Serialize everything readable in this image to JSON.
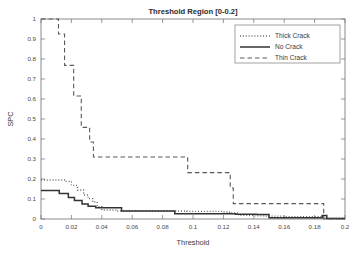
{
  "chart_data": {
    "type": "line",
    "title": "Threshold Region [0-0.2]",
    "xlabel": "Threshold",
    "ylabel": "SPC",
    "xlim": [
      0,
      0.2
    ],
    "ylim": [
      0,
      1
    ],
    "grid": false,
    "legend_position": "top-right",
    "xticks": [
      0,
      0.02,
      0.04,
      0.06,
      0.08,
      0.1,
      0.12,
      0.14,
      0.16,
      0.18,
      0.2
    ],
    "xticklabels": [
      "0",
      "0.02",
      "0.04",
      "0.06",
      "0.08",
      "0.1",
      "0.12",
      "0.14",
      "0.16",
      "0.18",
      "0.2"
    ],
    "yticks": [
      0,
      0.1,
      0.2,
      0.3,
      0.4,
      0.5,
      0.6,
      0.7,
      0.8,
      0.9,
      1
    ],
    "yticklabels": [
      "0",
      "0.1",
      "0.2",
      "0.3",
      "0.4",
      "0.5",
      "0.6",
      "0.7",
      "0.8",
      "0.9",
      "1"
    ],
    "series": [
      {
        "name": "Thick Crack",
        "style": "dotted",
        "color": "#555555",
        "x": [
          0,
          0.006,
          0.012,
          0.016,
          0.02,
          0.024,
          0.028,
          0.031,
          0.034,
          0.037,
          0.04,
          0.05,
          0.056,
          0.086,
          0.096,
          0.12,
          0.124,
          0.13,
          0.14,
          0.147,
          0.16,
          0.185,
          0.187,
          0.2
        ],
        "y": [
          0.195,
          0.195,
          0.195,
          0.188,
          0.168,
          0.145,
          0.12,
          0.102,
          0.085,
          0.062,
          0.045,
          0.04,
          0.04,
          0.04,
          0.038,
          0.035,
          0.03,
          0.018,
          0.016,
          0.014,
          0.012,
          0.01,
          0.004,
          0.004
        ]
      },
      {
        "name": "No Crack",
        "style": "solid",
        "color": "#333333",
        "x": [
          0,
          0.009,
          0.012,
          0.018,
          0.022,
          0.027,
          0.031,
          0.036,
          0.05,
          0.053,
          0.086,
          0.088,
          0.124,
          0.128,
          0.14,
          0.142,
          0.147,
          0.15,
          0.182,
          0.185,
          0.188,
          0.2
        ],
        "y": [
          0.142,
          0.142,
          0.128,
          0.108,
          0.092,
          0.075,
          0.064,
          0.056,
          0.056,
          0.04,
          0.04,
          0.026,
          0.026,
          0.024,
          0.024,
          0.022,
          0.022,
          0.006,
          0.006,
          0.018,
          0.002,
          0.002
        ]
      },
      {
        "name": "Thin Crack",
        "style": "dashed",
        "color": "#5a5a5a",
        "x": [
          0,
          0.01,
          0.0115,
          0.0125,
          0.0155,
          0.016,
          0.0215,
          0.0225,
          0.0265,
          0.0275,
          0.031,
          0.032,
          0.0335,
          0.0345,
          0.039,
          0.04,
          0.0955,
          0.0965,
          0.1235,
          0.1245,
          0.1255,
          0.1265,
          0.185,
          0.186,
          0.2
        ],
        "y": [
          1.0,
          1.0,
          0.925,
          0.925,
          0.768,
          0.768,
          0.615,
          0.615,
          0.458,
          0.458,
          0.458,
          0.385,
          0.385,
          0.31,
          0.31,
          0.31,
          0.31,
          0.232,
          0.232,
          0.155,
          0.155,
          0.077,
          0.077,
          0.0,
          0.0
        ]
      }
    ]
  },
  "legend": {
    "entries": [
      {
        "label": "Thick Crack",
        "style": "dotted"
      },
      {
        "label": "No Crack",
        "style": "solid"
      },
      {
        "label": "Thin Crack",
        "style": "dashed"
      }
    ]
  }
}
